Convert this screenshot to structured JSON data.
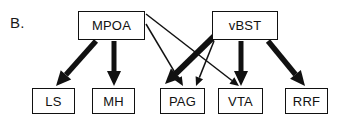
{
  "figure": {
    "panel_label": "B.",
    "width": 337,
    "height": 122,
    "background_color": "#ffffff",
    "stroke_color": "#111111"
  },
  "nodes": {
    "sources": [
      {
        "id": "MPOA",
        "label": "MPOA",
        "x": 78,
        "y": 11,
        "w": 67,
        "h": 29
      },
      {
        "id": "vBST",
        "label": "vBST",
        "x": 212,
        "y": 11,
        "w": 66,
        "h": 29
      }
    ],
    "targets": [
      {
        "id": "LS",
        "label": "LS",
        "x": 32,
        "y": 88,
        "w": 43,
        "h": 26
      },
      {
        "id": "MH",
        "label": "MH",
        "x": 92,
        "y": 88,
        "w": 43,
        "h": 26
      },
      {
        "id": "PAG",
        "label": "PAG",
        "x": 160,
        "y": 88,
        "w": 45,
        "h": 26
      },
      {
        "id": "VTA",
        "label": "VTA",
        "x": 218,
        "y": 88,
        "w": 45,
        "h": 26
      },
      {
        "id": "RRF",
        "label": "RRF",
        "x": 285,
        "y": 88,
        "w": 43,
        "h": 26
      }
    ]
  },
  "edges": [
    {
      "id": "mpoa-ls",
      "from": "MPOA",
      "to": "LS",
      "weight": "thick",
      "width": 5.5,
      "x1": 96,
      "y1": 41,
      "x2": 56,
      "y2": 86
    },
    {
      "id": "mpoa-mh",
      "from": "MPOA",
      "to": "MH",
      "weight": "thick",
      "width": 5.0,
      "x1": 114,
      "y1": 41,
      "x2": 114,
      "y2": 86
    },
    {
      "id": "mpoa-pag",
      "from": "MPOA",
      "to": "PAG",
      "weight": "thin",
      "width": 1.5,
      "x1": 146,
      "y1": 24,
      "x2": 183,
      "y2": 86
    },
    {
      "id": "mpoa-vta",
      "from": "MPOA",
      "to": "VTA",
      "weight": "thin",
      "width": 1.5,
      "x1": 146,
      "y1": 14,
      "x2": 239,
      "y2": 86
    },
    {
      "id": "vbst-pag",
      "from": "vBST",
      "to": "PAG",
      "weight": "thick",
      "width": 6.0,
      "x1": 237,
      "y1": 14,
      "x2": 165,
      "y2": 84
    },
    {
      "id": "vbst-vta",
      "from": "vBST",
      "to": "VTA",
      "weight": "thick",
      "width": 5.0,
      "x1": 241,
      "y1": 41,
      "x2": 241,
      "y2": 86
    },
    {
      "id": "vbst-rrf",
      "from": "vBST",
      "to": "RRF",
      "weight": "thick",
      "width": 5.5,
      "x1": 268,
      "y1": 41,
      "x2": 305,
      "y2": 86
    },
    {
      "id": "vbst-thin-left",
      "from": "vBST",
      "to": "PAG",
      "weight": "thin",
      "width": 1.5,
      "x1": 214,
      "y1": 41,
      "x2": 196,
      "y2": 86
    }
  ],
  "arrowheads": {
    "thick_length": 15,
    "thick_half_width": 7,
    "thin_length": 9,
    "thin_half_width": 4
  }
}
